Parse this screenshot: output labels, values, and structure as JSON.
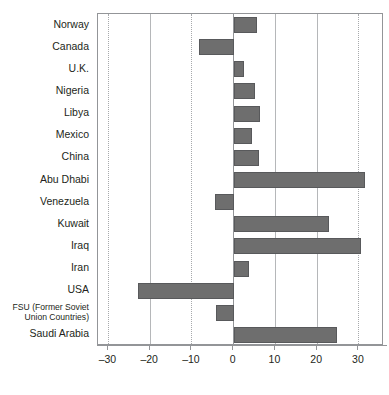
{
  "chart_data": {
    "type": "bar",
    "orientation": "horizontal",
    "title": "",
    "subtitle": "",
    "xlabel": "",
    "ylabel": "",
    "xlim": [
      -32.5,
      36
    ],
    "xticks": [
      -30,
      -20,
      -10,
      0,
      10,
      20,
      30
    ],
    "xtick_labels": [
      "–30",
      "–20",
      "–10",
      "0",
      "10",
      "20",
      "30"
    ],
    "grid": true,
    "grid_axis": "x",
    "legend": "none",
    "bar_color": "#6e6e6e",
    "bar_edge_color": "#58595b",
    "categories": [
      "Norway",
      "Canada",
      "U.K.",
      "Nigeria",
      "Libya",
      "Mexico",
      "China",
      "Abu Dhabi",
      "Venezuela",
      "Kuwait",
      "Iraq",
      "Iran",
      "USA",
      "FSU (Former Soviet Union Countries)",
      "Saudi Arabia"
    ],
    "values": [
      5.5,
      -8.3,
      2.4,
      5.0,
      6.2,
      4.3,
      6.0,
      31.5,
      -4.5,
      22.8,
      30.5,
      3.6,
      -22.8,
      -4.3,
      24.8
    ]
  },
  "axis": {
    "category_labels": [
      {
        "text": "Norway",
        "multiline": false
      },
      {
        "text": "Canada",
        "multiline": false
      },
      {
        "text": "U.K.",
        "multiline": false
      },
      {
        "text": "Nigeria",
        "multiline": false
      },
      {
        "text": "Libya",
        "multiline": false
      },
      {
        "text": "Mexico",
        "multiline": false
      },
      {
        "text": "China",
        "multiline": false
      },
      {
        "text": "Abu Dhabi",
        "multiline": false
      },
      {
        "text": "Venezuela",
        "multiline": false
      },
      {
        "text": "Kuwait",
        "multiline": false
      },
      {
        "text": "Iraq",
        "multiline": false
      },
      {
        "text": "Iran",
        "multiline": false
      },
      {
        "text": "USA",
        "multiline": false
      },
      {
        "text": "FSU (Former Soviet Union Countries)",
        "multiline": true
      },
      {
        "text": "Saudi Arabia",
        "multiline": false
      }
    ]
  },
  "colors": {
    "bar_fill": "#6e6e6e",
    "bar_stroke": "#58595b",
    "frame": "#939598",
    "gridline_dotted": "#a7a9ac",
    "gridline_solid": "#b5b7b9",
    "text": "#231f20",
    "background": "#ffffff"
  }
}
